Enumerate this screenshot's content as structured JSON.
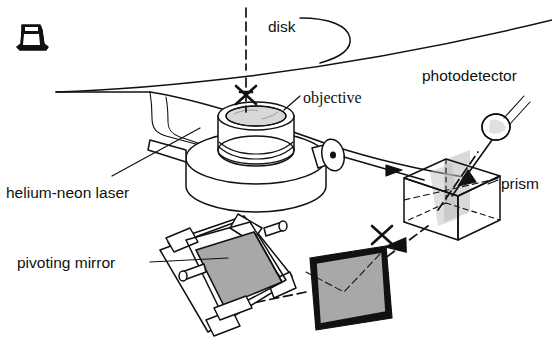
{
  "figure": {
    "background_color": "#ffffff",
    "ink_color": "#111111",
    "mirror_fill": "#a8a8a8",
    "prism_fill": "#b9b9b9"
  },
  "labels": {
    "disk": "disk",
    "objective": "objective",
    "photodetector": "photodetector",
    "prism": "prism",
    "laser": "helium-neon laser",
    "pivoting_mirror": "pivoting mirror"
  },
  "components": {
    "spindle_icon": "spindle-hub",
    "disk_surface": "disk-surface-arc",
    "laser_tube": "helium-neon-laser-tube",
    "objective_lens": "objective-lens-barrel",
    "objective_base": "objective-base-disc",
    "beam_tube": "beam-output-tube",
    "prism_cube": "beam-splitter-prism-cube",
    "photodetector_body": "photodetector-sphere",
    "pivoting_mirror_assembly": "pivoting-mirror-gimbal",
    "flat_mirror": "flat-fold-mirror"
  },
  "beams": {
    "vertical_to_disk": "dashed-vertical-beam",
    "objective_to_prism": "solid-beam-arrow",
    "prism_to_detector": "beam-to-photodetector",
    "prism_to_mirror": "dashed-beam-down-left",
    "mirror_to_pivot": "dashed-beam-to-pivoting-mirror",
    "focus_marker": "x-focus-marker"
  }
}
